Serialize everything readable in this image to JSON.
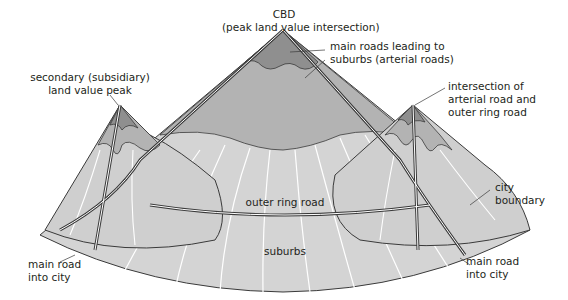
{
  "colors": {
    "background": "#ffffff",
    "base": "#d4d4d4",
    "mid": "#b3b3b3",
    "peak": "#8f8f8f",
    "outline": "#3a3a3a",
    "radial": "#ffffff"
  },
  "labels": {
    "cbd": {
      "line1": "CBD",
      "line2": "(peak land value intersection)"
    },
    "main_roads": {
      "line1": "main roads leading to",
      "line2": "suburbs (arterial roads)"
    },
    "secondary_peak": {
      "line1": "secondary (subsidiary)",
      "line2": "land value peak"
    },
    "intersection": {
      "line1": "intersection of",
      "line2": "arterial road and",
      "line3": "outer ring road"
    },
    "city_boundary": {
      "line1": "city",
      "line2": "boundary"
    },
    "outer_ring_road": "outer ring road",
    "suburbs": "suburbs",
    "main_road_left": {
      "line1": "main road",
      "line2": "into city"
    },
    "main_road_right": {
      "line1": "main road",
      "line2": "into city"
    }
  }
}
